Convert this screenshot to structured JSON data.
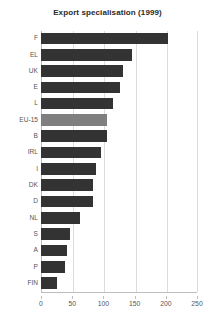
{
  "chart_data": {
    "type": "bar",
    "orientation": "horizontal",
    "title": "Export specialisation (1999)",
    "xlabel": "",
    "ylabel": "",
    "categories": [
      "F",
      "EL",
      "UK",
      "E",
      "L",
      "EU-15",
      "B",
      "IRL",
      "I",
      "DK",
      "D",
      "NL",
      "S",
      "A",
      "P",
      "FIN"
    ],
    "values": [
      204,
      146,
      131,
      126,
      116,
      106,
      106,
      96,
      88,
      84,
      84,
      63,
      46,
      42,
      38,
      26
    ],
    "highlight_category": "EU-15",
    "xlim": [
      0,
      250
    ],
    "xticks": [
      0,
      50,
      100,
      150,
      200,
      250
    ],
    "xtick_labels": [
      "0",
      "50",
      "100",
      "150",
      "200",
      "250"
    ],
    "grid": "vertical",
    "legend": null,
    "colors": {
      "bar": "#333333",
      "bar_highlight": "#7f7f7f",
      "gridline": "#dcdcdc",
      "axis": "#bdbdbd",
      "text": "#555555",
      "title": "#2a2a2a",
      "background": "#ffffff"
    }
  }
}
